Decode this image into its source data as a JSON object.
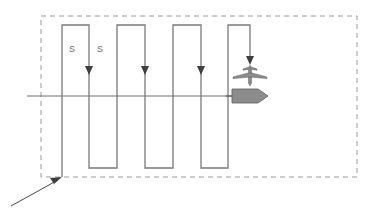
{
  "figure": {
    "type": "search-pattern-diagram",
    "title": "",
    "canvas": {
      "width": 371,
      "height": 214,
      "background": "#ffffff"
    }
  },
  "colors": {
    "search_area_border": "#9a9a9a",
    "track_line": "#7a7a7a",
    "datum_line": "#6e6e6e",
    "arrow": "#4a4a4a",
    "vehicle_fill": "#8c8c8c",
    "vehicle_stroke": "#5e5e5e",
    "label_text": "#6b6b6b"
  },
  "search_area": {
    "name": "search-area",
    "style": "dashed",
    "x": 41,
    "y": 16,
    "width": 316,
    "height": 161
  },
  "datum_line": {
    "name": "datum-line",
    "x1": 27,
    "y1": 96,
    "x2": 233,
    "y2": 96
  },
  "entry_arrow": {
    "name": "entry-arrow",
    "from_x": 11,
    "from_y": 206,
    "to_x": 62,
    "to_y": 177,
    "label": ""
  },
  "track_spacing_labels": [
    {
      "text": "S",
      "x": 72,
      "y": 52
    },
    {
      "text": "S",
      "x": 100,
      "y": 52
    }
  ],
  "track_path": {
    "name": "serpentine-track",
    "description": "parallel track (ladder) search pattern",
    "points": [
      [
        62,
        177
      ],
      [
        62,
        25
      ],
      [
        89,
        25
      ],
      [
        89,
        168
      ],
      [
        117,
        168
      ],
      [
        117,
        25
      ],
      [
        145,
        25
      ],
      [
        145,
        168
      ],
      [
        173,
        168
      ],
      [
        173,
        25
      ],
      [
        201,
        25
      ],
      [
        201,
        168
      ],
      [
        228,
        168
      ],
      [
        228,
        25
      ],
      [
        250,
        25
      ],
      [
        250,
        63
      ]
    ]
  },
  "leg_arrowheads": [
    {
      "x": 89,
      "y": 72,
      "direction": "down"
    },
    {
      "x": 145,
      "y": 72,
      "direction": "down"
    },
    {
      "x": 201,
      "y": 72,
      "direction": "down"
    },
    {
      "x": 250,
      "y": 62,
      "direction": "down"
    }
  ],
  "vehicles": [
    {
      "name": "aircraft-icon",
      "type": "aircraft",
      "x": 250,
      "y": 72,
      "heading": "down"
    },
    {
      "name": "ship-icon",
      "type": "ship",
      "x": 228,
      "y": 96,
      "heading": "right"
    }
  ]
}
